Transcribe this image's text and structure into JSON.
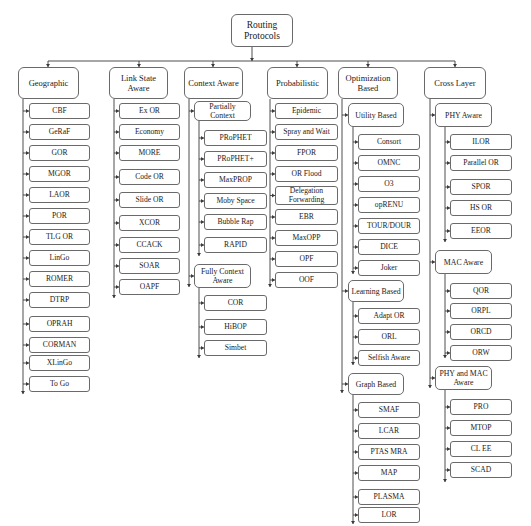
{
  "diagram": {
    "title": "Routing Protocols",
    "root": {
      "label": "Routing\nProtocols",
      "x": 231,
      "y": 14,
      "w": 62,
      "h": 33
    },
    "bus": {
      "y": 61,
      "x1": 48,
      "x2": 455,
      "root_x": 252
    },
    "categories": [
      {
        "label": "Geographic",
        "x": 18,
        "y": 67,
        "w": 61,
        "h": 32,
        "drop_x": 48,
        "spine_x": 23,
        "spine_end": 394,
        "children": [
          {
            "label": "CBF",
            "y": 103
          },
          {
            "label": "GeRaF",
            "y": 124
          },
          {
            "label": "GOR",
            "y": 145
          },
          {
            "label": "MGOR",
            "y": 166
          },
          {
            "label": "LAOR",
            "y": 187
          },
          {
            "label": "POR",
            "y": 208
          },
          {
            "label": "TLG OR",
            "y": 229
          },
          {
            "label": "LinGo",
            "y": 250
          },
          {
            "label": "ROMER",
            "y": 271
          },
          {
            "label": "DTRP",
            "y": 292
          },
          {
            "label": "OPRAH",
            "y": 316
          },
          {
            "label": "CORMAN",
            "y": 337
          },
          {
            "label": "XLinGo",
            "y": 355
          },
          {
            "label": "To Go",
            "y": 376
          }
        ],
        "child_x": 29,
        "child_w": 61
      },
      {
        "label": "Link State Aware",
        "x": 109,
        "y": 67,
        "w": 59,
        "h": 32,
        "drop_x": 139,
        "spine_x": 114,
        "spine_end": 298,
        "children": [
          {
            "label": "Ex OR",
            "y": 103
          },
          {
            "label": "Economy",
            "y": 124
          },
          {
            "label": "MORE",
            "y": 145
          },
          {
            "label": "Code OR",
            "y": 169
          },
          {
            "label": "Slide OR",
            "y": 192
          },
          {
            "label": "XCOR",
            "y": 215
          },
          {
            "label": "CCACK",
            "y": 237
          },
          {
            "label": "SOAR",
            "y": 258
          },
          {
            "label": "OAPF",
            "y": 279
          }
        ],
        "child_x": 119,
        "child_w": 61
      },
      {
        "label": "Context Aware",
        "x": 184,
        "y": 67,
        "w": 59,
        "h": 32,
        "drop_x": 213,
        "spine_x": 189,
        "spine_end": 287,
        "subgroups": [
          {
            "label": "Partially Context",
            "x": 194,
            "y": 101,
            "w": 57,
            "h": 20,
            "spine_x": 199,
            "spine_end": 256,
            "child_x": 204,
            "child_w": 63,
            "children": [
              {
                "label": "PRoPHET",
                "y": 130
              },
              {
                "label": "PRoPHET+",
                "y": 151
              },
              {
                "label": "MaxPROP",
                "y": 172
              },
              {
                "label": "Moby Space",
                "y": 193
              },
              {
                "label": "Bubble Rap",
                "y": 214
              },
              {
                "label": "RAPID",
                "y": 237
              }
            ]
          },
          {
            "label": "Fully Context\nAware",
            "x": 194,
            "y": 264,
            "w": 57,
            "h": 24,
            "spine_x": 199,
            "spine_end": 358,
            "child_x": 204,
            "child_w": 63,
            "children": [
              {
                "label": "COR",
                "y": 295
              },
              {
                "label": "HiBOP",
                "y": 319
              },
              {
                "label": "Simbet",
                "y": 340
              }
            ]
          }
        ]
      },
      {
        "label": "Probabilistic",
        "x": 267,
        "y": 67,
        "w": 61,
        "h": 32,
        "drop_x": 297,
        "spine_x": 270,
        "spine_end": 287,
        "children": [
          {
            "label": "Epidemic",
            "y": 103
          },
          {
            "label": "Spray and Wait",
            "y": 124
          },
          {
            "label": "FPOR",
            "y": 145
          },
          {
            "label": "OR Flood",
            "y": 166
          },
          {
            "label": "Delegation\nForwarding",
            "y": 186,
            "h": 19
          },
          {
            "label": "EBR",
            "y": 209
          },
          {
            "label": "MaxOPP",
            "y": 230
          },
          {
            "label": "OPF",
            "y": 251
          },
          {
            "label": "OOF",
            "y": 272
          }
        ],
        "child_x": 275,
        "child_w": 63
      },
      {
        "label": "Optimization\nBased",
        "x": 338,
        "y": 67,
        "w": 60,
        "h": 32,
        "drop_x": 368,
        "spine_x": 342,
        "spine_end": 393,
        "subgroups": [
          {
            "label": "Utility Based",
            "x": 348,
            "y": 103,
            "w": 56,
            "h": 24,
            "spine_x": 353,
            "spine_end": 274,
            "child_x": 358,
            "child_w": 62,
            "children": [
              {
                "label": "Consort",
                "y": 134
              },
              {
                "label": "OMNC",
                "y": 155
              },
              {
                "label": "O3",
                "y": 176
              },
              {
                "label": "opRENU",
                "y": 197
              },
              {
                "label": "TOUR/DOUR",
                "y": 218
              },
              {
                "label": "DICE",
                "y": 239
              },
              {
                "label": "Joker",
                "y": 260
              }
            ]
          },
          {
            "label": "Learning Based",
            "x": 348,
            "y": 280,
            "w": 56,
            "h": 22,
            "spine_x": 353,
            "spine_end": 365,
            "child_x": 358,
            "child_w": 62,
            "children": [
              {
                "label": "Adapt OR",
                "y": 308
              },
              {
                "label": "ORL",
                "y": 329
              },
              {
                "label": "Selfish Aware",
                "y": 350
              }
            ]
          },
          {
            "label": "Graph Based",
            "x": 348,
            "y": 373,
            "w": 56,
            "h": 22,
            "spine_x": 353,
            "spine_end": 524,
            "child_x": 358,
            "child_w": 62,
            "children": [
              {
                "label": "SMAF",
                "y": 402
              },
              {
                "label": "LCAR",
                "y": 423
              },
              {
                "label": "PTAS MRA",
                "y": 444
              },
              {
                "label": "MAP",
                "y": 465
              },
              {
                "label": "PLASMA",
                "y": 489
              },
              {
                "label": "LOR",
                "y": 507
              }
            ]
          }
        ]
      },
      {
        "label": "Cross Layer",
        "x": 424,
        "y": 67,
        "w": 62,
        "h": 32,
        "drop_x": 455,
        "spine_x": 430,
        "spine_end": 388,
        "subgroups": [
          {
            "label": "PHY Aware",
            "x": 435,
            "y": 103,
            "w": 57,
            "h": 24,
            "spine_x": 445,
            "spine_end": 242,
            "child_x": 450,
            "child_w": 62,
            "children": [
              {
                "label": "ILOR",
                "y": 134
              },
              {
                "label": "Parallel OR",
                "y": 155
              },
              {
                "label": "SPOR",
                "y": 179
              },
              {
                "label": "HS OR",
                "y": 200
              },
              {
                "label": "EEOR",
                "y": 223
              }
            ]
          },
          {
            "label": "MAC Aware",
            "x": 435,
            "y": 250,
            "w": 57,
            "h": 24,
            "spine_x": 445,
            "spine_end": 358,
            "child_x": 450,
            "child_w": 62,
            "children": [
              {
                "label": "QOR",
                "y": 283
              },
              {
                "label": "ORPL",
                "y": 303
              },
              {
                "label": "ORCD",
                "y": 324
              },
              {
                "label": "ORW",
                "y": 345
              }
            ]
          },
          {
            "label": "PHY and MAC\nAware",
            "x": 435,
            "y": 366,
            "w": 57,
            "h": 24,
            "spine_x": 445,
            "spine_end": 482,
            "child_x": 450,
            "child_w": 62,
            "children": [
              {
                "label": "PRO",
                "y": 399
              },
              {
                "label": "MTOP",
                "y": 420
              },
              {
                "label": "CL EE",
                "y": 441
              },
              {
                "label": "SCAD",
                "y": 462
              }
            ]
          }
        ]
      }
    ],
    "leaf_h": 16,
    "colors": {
      "line": "#3a3a3a",
      "border": "#6a6a6a",
      "text": "#1a1a1a",
      "background": "#ffffff"
    }
  }
}
